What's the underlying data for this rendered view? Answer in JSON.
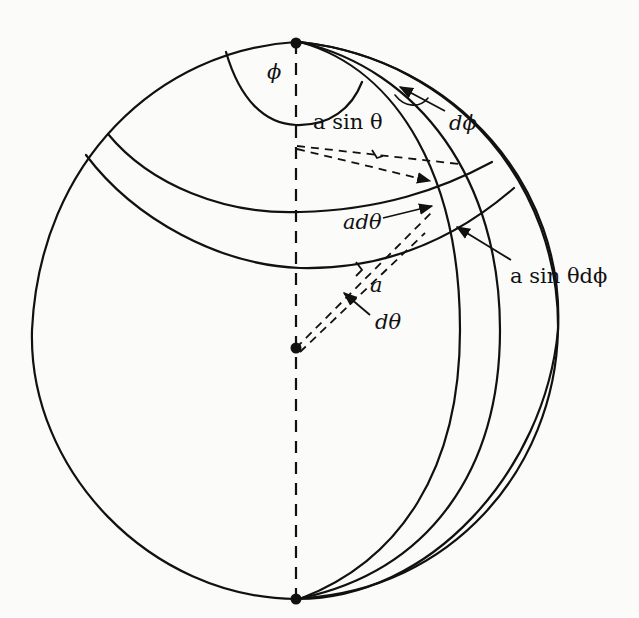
{
  "figure": {
    "labels": {
      "phi": "ϕ",
      "a_sin_theta": "a sin θ",
      "d_phi": "dϕ",
      "a_d_theta": "adθ",
      "a_sin_theta_d_phi": "a sin θdϕ",
      "a": "a",
      "d_theta": "dθ"
    },
    "colors": {
      "ink": "#111111",
      "paper": "#fbfbfa"
    }
  }
}
